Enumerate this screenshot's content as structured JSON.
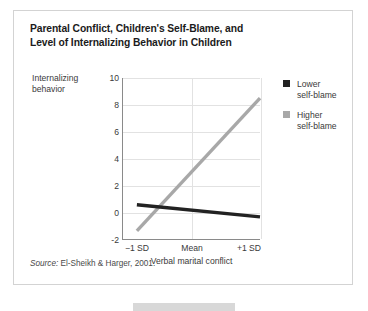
{
  "figure": {
    "title_lines": [
      "Parental Conflict, Children's Self-Blame, and",
      "Level of Internalizing Behavior in Children"
    ],
    "source_label": "Source:",
    "source_text": " El-Sheikh & Harger, 2001."
  },
  "legend": {
    "position": "right",
    "entries": [
      {
        "lines": [
          "Lower",
          "self-blame"
        ],
        "color": "#222222"
      },
      {
        "lines": [
          "Higher",
          "self-blame"
        ],
        "color": "#a8a8a8"
      }
    ]
  },
  "colors": {
    "lower_self_blame": "#222222",
    "higher_self_blame": "#a8a8a8",
    "grid": "#e2e2e2",
    "axis": "#8a8a8a",
    "card_border": "#d3d3d3",
    "text": "#3a3a3a",
    "title_text": "#1b1b1b"
  },
  "chart_data": {
    "type": "line",
    "title": "Parental Conflict, Children's Self-Blame, and Level of Internalizing Behavior in Children",
    "xlabel": "Verbal marital conflict",
    "ylabel": "Internalizing behavior",
    "ylabel_lines": [
      "Internalizing",
      "behavior"
    ],
    "x": [
      "−1 SD",
      "Mean",
      "+1 SD"
    ],
    "x_numeric": [
      -1,
      0,
      1
    ],
    "xtick_labels": [
      "−1 SD",
      "Mean",
      "+1 SD"
    ],
    "ytick_labels": [
      "10",
      "8",
      "6",
      "4",
      "2",
      "0",
      "-2"
    ],
    "yticks": [
      10,
      8,
      6,
      4,
      2,
      0,
      -2
    ],
    "ylim": [
      -2,
      10
    ],
    "xlim": [
      -1,
      1
    ],
    "grid": "horizontal-and-vertical",
    "legend_position": "right",
    "series": [
      {
        "name": "Lower self-blame",
        "color": "#222222",
        "values": [
          0.55,
          0.1,
          -0.35
        ]
      },
      {
        "name": "Higher self-blame",
        "color": "#a8a8a8",
        "values": [
          -1.4,
          3.55,
          8.5
        ]
      }
    ],
    "source": "Source: El-Sheikh & Harger, 2001."
  }
}
